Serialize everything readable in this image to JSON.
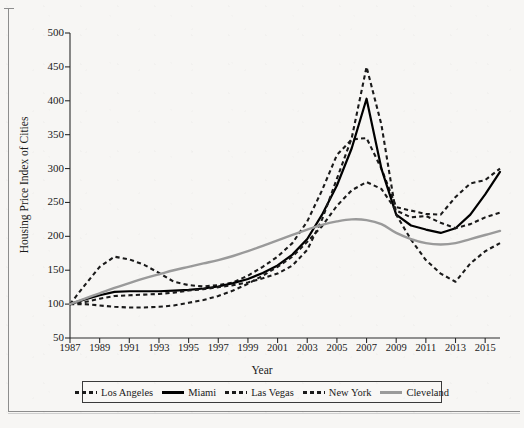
{
  "chart_data": {
    "type": "line",
    "title": "",
    "xlabel": "Year",
    "ylabel": "Housing Price Index of Cities",
    "xlim": [
      1987,
      2016
    ],
    "ylim": [
      50,
      500
    ],
    "grid": false,
    "legend_position": "bottom",
    "xticks": [
      1987,
      1989,
      1991,
      1993,
      1995,
      1997,
      1999,
      2001,
      2003,
      2005,
      2007,
      2009,
      2011,
      2013,
      2015
    ],
    "yticks": [
      50,
      100,
      150,
      200,
      250,
      300,
      350,
      400,
      450,
      500
    ],
    "x": [
      1987,
      1988,
      1989,
      1990,
      1991,
      1992,
      1993,
      1994,
      1995,
      1996,
      1997,
      1998,
      1999,
      2000,
      2001,
      2002,
      2003,
      2004,
      2005,
      2006,
      2007,
      2008,
      2009,
      2010,
      2011,
      2012,
      2013,
      2014,
      2015,
      2016
    ],
    "series": [
      {
        "name": "Los Angeles",
        "color": "#1a1a1a",
        "style": "dashed",
        "values": [
          100,
          128,
          155,
          170,
          166,
          158,
          146,
          133,
          128,
          126,
          128,
          132,
          142,
          155,
          170,
          190,
          222,
          268,
          320,
          343,
          345,
          300,
          243,
          238,
          233,
          232,
          258,
          278,
          283,
          300
        ]
      },
      {
        "name": "Miami",
        "color": "#000000",
        "style": "solid",
        "values": [
          100,
          107,
          113,
          118,
          119,
          119,
          119,
          120,
          121,
          123,
          126,
          131,
          137,
          146,
          157,
          173,
          196,
          232,
          275,
          330,
          403,
          300,
          232,
          216,
          210,
          205,
          212,
          232,
          262,
          295
        ]
      },
      {
        "name": "Las Vegas",
        "color": "#1a1a1a",
        "style": "dashed",
        "values": [
          100,
          103,
          108,
          112,
          113,
          114,
          115,
          117,
          120,
          122,
          125,
          128,
          132,
          138,
          145,
          157,
          180,
          225,
          285,
          345,
          450,
          365,
          232,
          195,
          165,
          145,
          133,
          160,
          178,
          190
        ]
      },
      {
        "name": "New York",
        "color": "#1a1a1a",
        "style": "dashed",
        "values": [
          100,
          100,
          98,
          96,
          95,
          95,
          96,
          98,
          102,
          106,
          112,
          120,
          130,
          142,
          155,
          170,
          192,
          215,
          245,
          268,
          280,
          270,
          238,
          228,
          230,
          220,
          212,
          218,
          228,
          235
        ]
      },
      {
        "name": "Cleveland",
        "color": "#9a9a9a",
        "style": "solid",
        "values": [
          100,
          108,
          116,
          124,
          131,
          138,
          144,
          150,
          155,
          160,
          165,
          171,
          178,
          186,
          194,
          202,
          210,
          217,
          222,
          225,
          224,
          218,
          205,
          196,
          190,
          188,
          190,
          196,
          202,
          208
        ]
      }
    ]
  },
  "axis": {
    "xlabel": "Year",
    "ylabel": "Housing Price Index of Cities"
  }
}
